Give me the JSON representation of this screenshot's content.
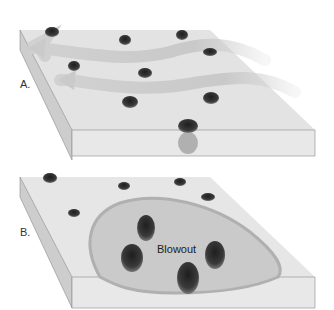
{
  "panels": [
    {
      "id": "A",
      "label": "A.",
      "description": "Flat sand surface with scattered shrubs; wind arrows blowing right to left"
    },
    {
      "id": "B",
      "label": "B.",
      "description": "Blowout depression excavated by wind around shrubs"
    }
  ],
  "annotations": {
    "blowout": "Blowout"
  },
  "colors": {
    "surface": "#e4e4e4",
    "side": "#cfcfcf",
    "front": "#e6e6e6",
    "wind": "#c8c8c8",
    "shrub": "#3a3a3a",
    "blowout_fill": "#c9c9c9",
    "blowout_rim": "#b5b5b5"
  }
}
